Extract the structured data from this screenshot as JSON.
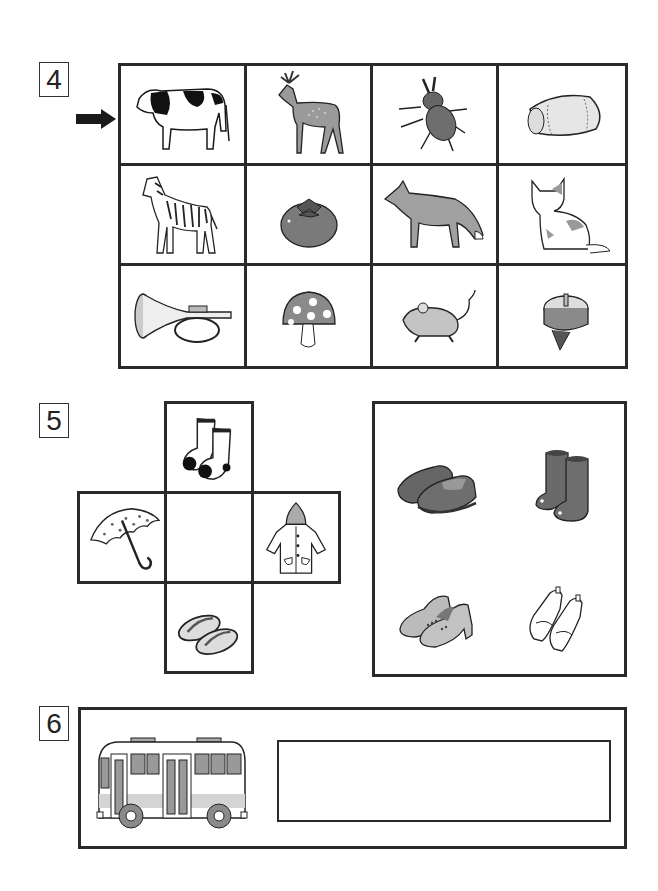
{
  "worksheet": {
    "questions": [
      {
        "number": "4",
        "pointer": "arrow-right",
        "grid": {
          "rows": 3,
          "cols": 4,
          "items": [
            [
              "cow",
              "deer",
              "stag beetle",
              "drum"
            ],
            [
              "zebra",
              "persimmon",
              "fox",
              "cat"
            ],
            [
              "trumpet",
              "mushroom",
              "mouse",
              "spinning top"
            ]
          ]
        }
      },
      {
        "number": "5",
        "cross": {
          "top": "socks",
          "left": "umbrella",
          "center": "",
          "right": "raincoat",
          "bottom": "sandals (zori)"
        },
        "choices": [
          "loafers",
          "rain boots",
          "high-heel shoes",
          "indoor shoes"
        ]
      },
      {
        "number": "6",
        "picture": "bus",
        "answer_box": ""
      }
    ]
  },
  "colors": {
    "line": "#2a2a2a",
    "mid_gray": "#8c8c8c",
    "light_gray": "#c8c8c8",
    "dark_gray": "#5a5a5a"
  }
}
